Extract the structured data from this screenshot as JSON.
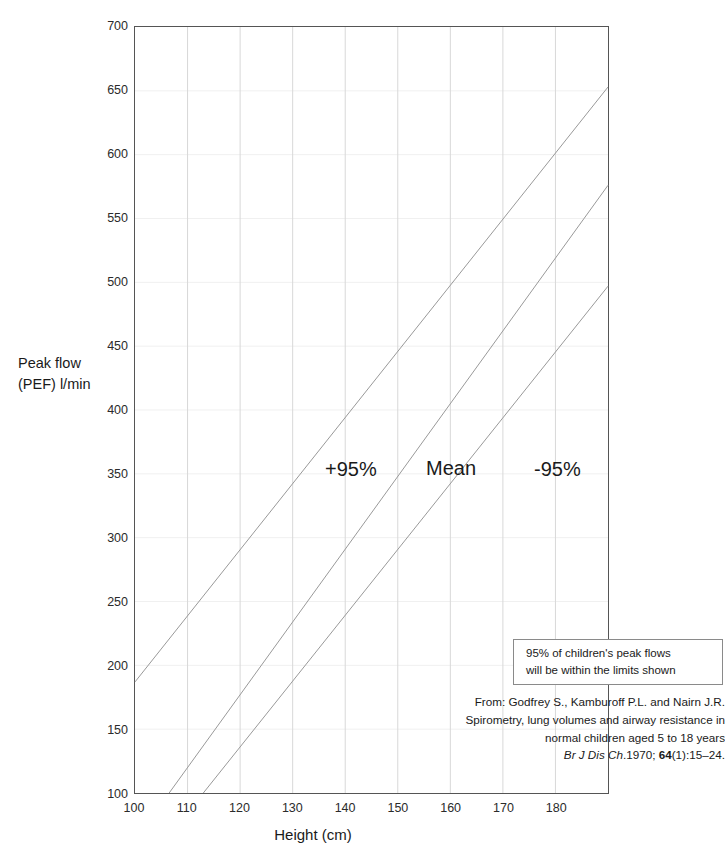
{
  "chart_data": {
    "type": "line",
    "title": "",
    "subtitle": "",
    "xlabel": "Height (cm)",
    "ylabel": "Peak flow\n(PEF) l/min",
    "ylabel_line1": "Peak flow",
    "ylabel_line2": "(PEF) l/min",
    "xlim": [
      100,
      190
    ],
    "ylim": [
      100,
      700
    ],
    "xticks": [
      100,
      110,
      120,
      130,
      140,
      150,
      160,
      170,
      180
    ],
    "yticks": [
      100,
      150,
      200,
      250,
      300,
      350,
      400,
      450,
      500,
      550,
      600,
      650,
      700
    ],
    "grid": "both",
    "legend_position": "inline-on-curves",
    "series": [
      {
        "name": "+95%",
        "label": "+95%",
        "color": "#999999",
        "x": [
          100,
          190
        ],
        "y": [
          187,
          653
        ],
        "points": [
          {
            "x": 100,
            "y": 187
          },
          {
            "x": 110,
            "y": 239
          },
          {
            "x": 120,
            "y": 291
          },
          {
            "x": 130,
            "y": 343
          },
          {
            "x": 140,
            "y": 394
          },
          {
            "x": 150,
            "y": 446
          },
          {
            "x": 160,
            "y": 498
          },
          {
            "x": 170,
            "y": 550
          },
          {
            "x": 180,
            "y": 602
          },
          {
            "x": 190,
            "y": 653
          }
        ]
      },
      {
        "name": "Mean",
        "label": "Mean",
        "color": "#999999",
        "x": [
          106.5,
          190
        ],
        "y": [
          100,
          576
        ],
        "points": [
          {
            "x": 110,
            "y": 120
          },
          {
            "x": 120,
            "y": 177
          },
          {
            "x": 130,
            "y": 234
          },
          {
            "x": 140,
            "y": 291
          },
          {
            "x": 150,
            "y": 348
          },
          {
            "x": 160,
            "y": 405
          },
          {
            "x": 170,
            "y": 462
          },
          {
            "x": 180,
            "y": 519
          },
          {
            "x": 190,
            "y": 576
          }
        ]
      },
      {
        "name": "-95%",
        "label": "-95%",
        "color": "#999999",
        "x": [
          113,
          190
        ],
        "y": [
          100,
          497
        ],
        "points": [
          {
            "x": 120,
            "y": 136
          },
          {
            "x": 130,
            "y": 188
          },
          {
            "x": 140,
            "y": 239
          },
          {
            "x": 150,
            "y": 291
          },
          {
            "x": 160,
            "y": 342
          },
          {
            "x": 170,
            "y": 394
          },
          {
            "x": 180,
            "y": 445
          },
          {
            "x": 190,
            "y": 497
          }
        ]
      }
    ],
    "annotations": {
      "note_box_line1": "95% of children's  peak flows",
      "note_box_line2": "will be within the limits shown",
      "citation_line1": "From: Godfrey S., Kamburoff P.L. and Nairn J.R.",
      "citation_line2": "Spirometry, lung volumes and airway resistance in",
      "citation_line3": "normal children aged 5 to 18 years",
      "citation_journal": "Br J Dis Ch",
      "citation_year": ".1970; ",
      "citation_volume": "64",
      "citation_pages": "(1):15–24."
    }
  },
  "colors": {
    "axis": "#555555",
    "grid_vertical": "#d8d8d8",
    "grid_horizontal": "#f0f0f0",
    "curve": "#999999",
    "text": "#1a1a1a",
    "note_border": "#8a8a8a",
    "background": "#ffffff"
  }
}
